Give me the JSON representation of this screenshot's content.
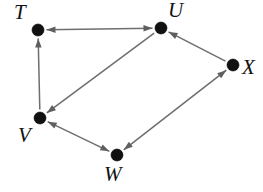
{
  "figure": {
    "kind": "directed-graph",
    "width": 263,
    "height": 192,
    "background_color": "#ffffff",
    "node_color": "#111111",
    "edge_color": "#6e6e6e",
    "label_color": "#111111",
    "node_radius": 6
  },
  "nodes": [
    {
      "id": "T",
      "label": "T",
      "x": 38,
      "y": 30,
      "label_x": 14,
      "label_y": 2
    },
    {
      "id": "U",
      "label": "U",
      "x": 161,
      "y": 28,
      "label_x": 168,
      "label_y": 0
    },
    {
      "id": "V",
      "label": "V",
      "x": 40,
      "y": 118,
      "label_x": 18,
      "label_y": 125
    },
    {
      "id": "W",
      "label": "W",
      "x": 117,
      "y": 155,
      "label_x": 104,
      "label_y": 164
    },
    {
      "id": "X",
      "label": "X",
      "x": 233,
      "y": 65,
      "label_x": 242,
      "label_y": 57
    }
  ],
  "edges": [
    {
      "from": "T",
      "to": "U",
      "arrow_at_from": true,
      "arrow_at_to": true,
      "name": "edge-t-u"
    },
    {
      "from": "V",
      "to": "T",
      "arrow_at_from": false,
      "arrow_at_to": true,
      "name": "edge-v-t"
    },
    {
      "from": "U",
      "to": "V",
      "arrow_at_from": false,
      "arrow_at_to": true,
      "name": "edge-u-v"
    },
    {
      "from": "V",
      "to": "W",
      "arrow_at_from": true,
      "arrow_at_to": true,
      "name": "edge-v-w"
    },
    {
      "from": "W",
      "to": "X",
      "arrow_at_from": true,
      "arrow_at_to": true,
      "name": "edge-w-x"
    },
    {
      "from": "X",
      "to": "U",
      "arrow_at_from": false,
      "arrow_at_to": true,
      "name": "edge-x-u"
    }
  ]
}
